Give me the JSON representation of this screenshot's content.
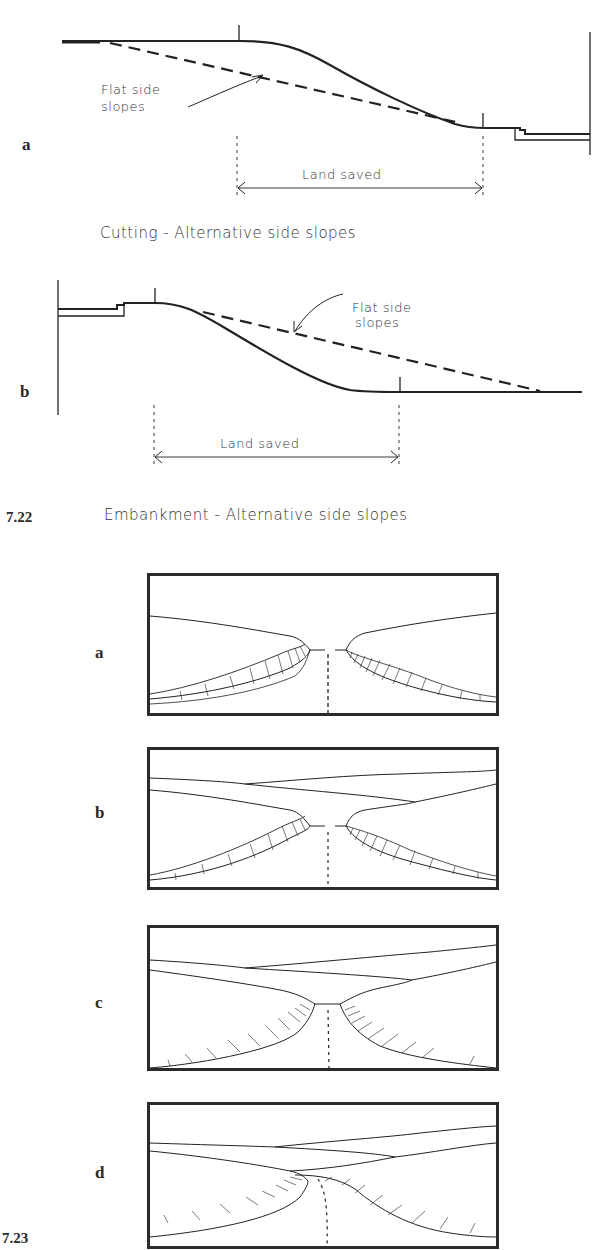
{
  "figure_7_22": {
    "number": "7.22",
    "caption": "Embankment - Alternative side slopes",
    "diagram_a": {
      "label": "a",
      "note": "Flat side slopes",
      "note_line1": "Flat side",
      "note_line2": "slopes",
      "dimension": "Land saved",
      "caption": "Cutting - Alternative side slopes"
    },
    "diagram_b": {
      "label": "b",
      "note_line1": "Flat side",
      "note_line2": "slopes",
      "dimension": "Land saved"
    }
  },
  "figure_7_23": {
    "number": "7.23",
    "panels": [
      {
        "label": "a",
        "description": "Road in cutting with steep hatched side slopes"
      },
      {
        "label": "b",
        "description": "Road in cutting with steep slopes, layered horizon"
      },
      {
        "label": "c",
        "description": "Road in cutting with flattened, rounded slopes"
      },
      {
        "label": "d",
        "description": "Curving road through flattened cutting"
      }
    ]
  },
  "colors": {
    "ink": "#222222",
    "background": "#ffffff",
    "frame": "#2b2b2b"
  }
}
